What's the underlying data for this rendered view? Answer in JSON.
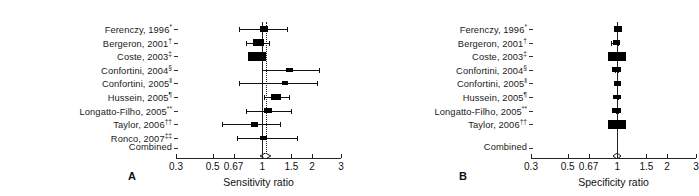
{
  "figure": {
    "panels": [
      {
        "letter": "A",
        "axis_title": "Sensitivity ratio",
        "tick_labels": [
          "0.3",
          "0.5",
          "0.67",
          "1",
          "1.5",
          "2",
          "3"
        ],
        "tick_values": [
          0.3,
          0.5,
          0.67,
          1,
          1.5,
          2,
          3
        ],
        "combined_label": "Combined",
        "rows": [
          {
            "label": "Ferenczy, 1996",
            "sup": "*",
            "estimate": 1.02,
            "low": 0.72,
            "high": 1.42,
            "weight": 0.3
          },
          {
            "label": "Bergeron, 2001",
            "sup": "†",
            "estimate": 0.95,
            "low": 0.8,
            "high": 1.1,
            "weight": 0.55
          },
          {
            "label": "Coste, 2003",
            "sup": "‡",
            "estimate": 0.93,
            "low": 0.84,
            "high": 1.02,
            "weight": 1.0
          },
          {
            "label": "Confortini, 2004",
            "sup": "§",
            "estimate": 1.47,
            "low": 1.0,
            "high": 2.2,
            "weight": 0.22
          },
          {
            "label": "Confortini, 2005",
            "sup": "‖",
            "estimate": 1.38,
            "low": 0.72,
            "high": 2.15,
            "weight": 0.14
          },
          {
            "label": "Hussein, 2005",
            "sup": "¶",
            "estimate": 1.21,
            "low": 1.03,
            "high": 1.45,
            "weight": 0.45
          },
          {
            "label": "Longatto-Filho, 2005",
            "sup": "**",
            "estimate": 1.08,
            "low": 0.8,
            "high": 1.5,
            "weight": 0.26
          },
          {
            "label": "Taylor, 2006",
            "sup": "††",
            "estimate": 0.9,
            "low": 0.57,
            "high": 1.28,
            "weight": 0.24
          },
          {
            "label": "Ronco, 2007",
            "sup": "‡‡",
            "estimate": 1.02,
            "low": 0.7,
            "high": 1.62,
            "weight": 0.2
          }
        ],
        "combined": {
          "estimate": 1.05,
          "low": 0.98,
          "high": 1.14
        }
      },
      {
        "letter": "B",
        "axis_title": "Specificity ratio",
        "tick_labels": [
          "0.3",
          "0.5",
          "0.67",
          "1",
          "1.5",
          "2",
          "3"
        ],
        "tick_values": [
          0.3,
          0.5,
          0.67,
          1,
          1.5,
          2,
          3
        ],
        "combined_label": "Combined",
        "rows": [
          {
            "label": "Ferenczy, 1996",
            "sup": "*",
            "estimate": 1.01,
            "low": 0.99,
            "high": 1.04,
            "weight": 0.3
          },
          {
            "label": "Bergeron, 2001",
            "sup": "†",
            "estimate": 0.99,
            "low": 0.92,
            "high": 1.01,
            "weight": 0.18
          },
          {
            "label": "Coste, 2003",
            "sup": "‡",
            "estimate": 1.0,
            "low": 0.98,
            "high": 1.02,
            "weight": 1.0
          },
          {
            "label": "Confortini, 2004",
            "sup": "§",
            "estimate": 0.99,
            "low": 0.97,
            "high": 1.01,
            "weight": 0.3
          },
          {
            "label": "Confortini, 2005",
            "sup": "‖",
            "estimate": 1.0,
            "low": 0.96,
            "high": 1.02,
            "weight": 0.22
          },
          {
            "label": "Hussein, 2005",
            "sup": "¶",
            "estimate": 1.0,
            "low": 0.99,
            "high": 1.01,
            "weight": 0.26
          },
          {
            "label": "Longatto-Filho, 2005",
            "sup": "**",
            "estimate": 0.99,
            "low": 0.98,
            "high": 1.01,
            "weight": 0.4
          },
          {
            "label": "Taylor, 2006",
            "sup": "††",
            "estimate": 1.0,
            "low": 0.98,
            "high": 1.03,
            "weight": 1.0
          }
        ],
        "combined": {
          "estimate": 1.0,
          "low": 0.99,
          "high": 1.01
        }
      }
    ]
  },
  "chart_data": {
    "type": "forest",
    "title": "",
    "scale": "log",
    "charts": [
      {
        "panel": "A",
        "xlabel": "Sensitivity ratio",
        "xlim": [
          0.3,
          3
        ],
        "xticks": [
          0.3,
          0.5,
          0.67,
          1,
          1.5,
          2,
          3
        ],
        "xticklabels": [
          "0.3",
          "0.5",
          "0.67",
          "1",
          "1.5",
          "2",
          "3"
        ],
        "reference_line": 1,
        "pooled_line": 1.05,
        "grid": false,
        "categories": [
          "Ferenczy, 1996*",
          "Bergeron, 2001†",
          "Coste, 2003‡",
          "Confortini, 2004§",
          "Confortini, 2005‖",
          "Hussein, 2005¶",
          "Longatto-Filho, 2005**",
          "Taylor, 2006††",
          "Ronco, 2007‡‡",
          "Combined"
        ],
        "estimates": [
          1.02,
          0.95,
          0.93,
          1.47,
          1.38,
          1.21,
          1.08,
          0.9,
          1.02,
          1.05
        ],
        "ci_low": [
          0.72,
          0.8,
          0.84,
          1.0,
          0.72,
          1.03,
          0.8,
          0.57,
          0.7,
          0.98
        ],
        "ci_high": [
          1.42,
          1.1,
          1.02,
          2.2,
          2.15,
          1.45,
          1.5,
          1.28,
          1.62,
          1.14
        ],
        "weights": [
          0.3,
          0.55,
          1.0,
          0.22,
          0.14,
          0.45,
          0.26,
          0.24,
          0.2,
          null
        ]
      },
      {
        "panel": "B",
        "xlabel": "Specificity ratio",
        "xlim": [
          0.3,
          3
        ],
        "xticks": [
          0.3,
          0.5,
          0.67,
          1,
          1.5,
          2,
          3
        ],
        "xticklabels": [
          "0.3",
          "0.5",
          "0.67",
          "1",
          "1.5",
          "2",
          "3"
        ],
        "reference_line": 1,
        "pooled_line": 1.0,
        "grid": false,
        "categories": [
          "Ferenczy, 1996*",
          "Bergeron, 2001†",
          "Coste, 2003‡",
          "Confortini, 2004§",
          "Confortini, 2005‖",
          "Hussein, 2005¶",
          "Longatto-Filho, 2005**",
          "Taylor, 2006††",
          "Combined"
        ],
        "estimates": [
          1.01,
          0.99,
          1.0,
          0.99,
          1.0,
          1.0,
          0.99,
          1.0,
          1.0
        ],
        "ci_low": [
          0.99,
          0.92,
          0.98,
          0.97,
          0.96,
          0.99,
          0.98,
          0.98,
          0.99
        ],
        "ci_high": [
          1.04,
          1.01,
          1.02,
          1.01,
          1.02,
          1.01,
          1.01,
          1.03,
          1.01
        ],
        "weights": [
          0.3,
          0.18,
          1.0,
          0.3,
          0.22,
          0.26,
          0.4,
          1.0,
          null
        ]
      }
    ]
  }
}
